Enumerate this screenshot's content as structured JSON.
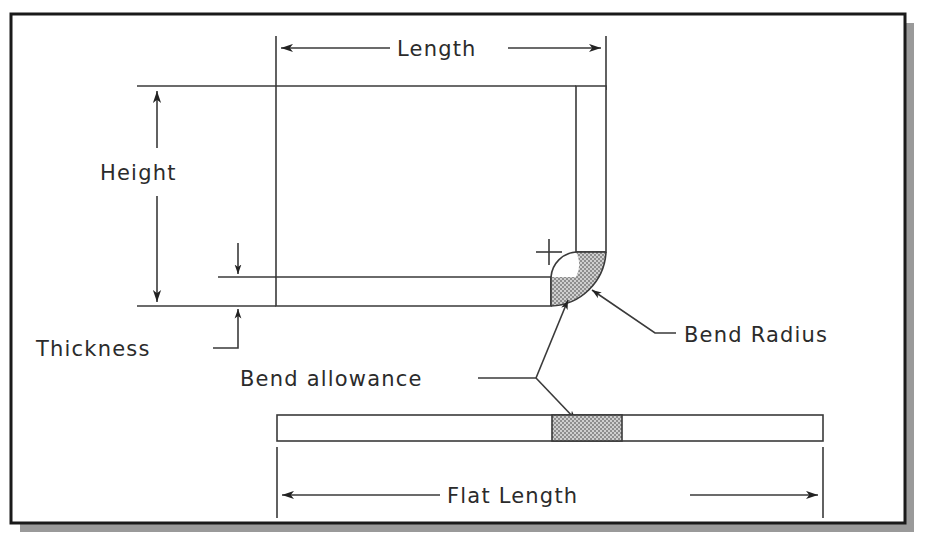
{
  "figure": {
    "frame": {
      "x": 11,
      "y": 14,
      "width": 894,
      "height": 509,
      "border_color": "#1a1a1a",
      "fill": "#ffffff",
      "shadow_color": "#9a9a9a",
      "shadow_offset": 9
    },
    "ink_color": "#3a3a3a",
    "hatch_color": "#a8a8a8",
    "hatch_edge": "#555555"
  },
  "labels": {
    "length": "Length",
    "height": "Height",
    "thickness": "Thickness",
    "bend_radius": "Bend Radius",
    "bend_allowance": "Bend allowance",
    "flat_length": "Flat Length"
  },
  "icons": {
    "center_mark": "plus-center-mark",
    "arrow": "dimension-arrowhead",
    "leader": "leader-line"
  },
  "geometry": {
    "bent_part": {
      "horizontal_arm": {
        "x1": 276,
        "y1": 277,
        "x2": 551,
        "y2": 306
      },
      "vertical_leg": {
        "x1": 576,
        "y1": 86,
        "x2": 606,
        "y2": 252
      },
      "bend_center": {
        "x": 549,
        "y": 252
      },
      "bend_inner_radius": 27,
      "bend_outer_radius": 57
    },
    "flat_part": {
      "strip": {
        "x1": 277,
        "y1": 415,
        "x2": 823,
        "y2": 441
      },
      "allowance_zone": {
        "x1": 552,
        "x2": 622
      }
    },
    "dimensions": {
      "length": {
        "y": 48,
        "x1": 276,
        "x2": 606,
        "ext_top": 36,
        "ext_bottom": 278
      },
      "height": {
        "x": 157,
        "y1": 88,
        "y2": 297,
        "ext_top_y": 86,
        "ext_bottom_y": 306
      },
      "thickness": {
        "x": 238,
        "y_top": 277,
        "y_bottom": 306
      },
      "flat_length": {
        "y": 495,
        "x1": 277,
        "x2": 823
      }
    }
  }
}
